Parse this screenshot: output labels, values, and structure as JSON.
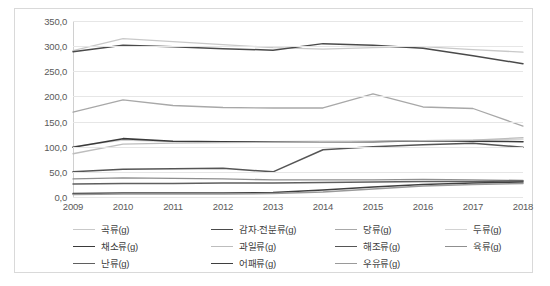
{
  "chart_data": {
    "type": "line",
    "title": "",
    "xlabel": "",
    "ylabel": "",
    "categories": [
      "2009",
      "2010",
      "2011",
      "2012",
      "2013",
      "2014",
      "2015",
      "2016",
      "2017",
      "2018"
    ],
    "ylim": [
      0,
      350
    ],
    "ytick_labels": [
      "0,0",
      "50,0",
      "100,0",
      "150,0",
      "200,0",
      "250,0",
      "300,0",
      "350,0"
    ],
    "ytick_values": [
      0,
      50,
      100,
      150,
      200,
      250,
      300,
      350
    ],
    "grid": true,
    "legend_position": "bottom",
    "series": [
      {
        "name": "곡류(g)",
        "color": "#c9c9c9",
        "width": 1.3,
        "values": [
          291,
          315,
          309,
          303,
          297,
          294,
          297,
          299,
          293,
          288
        ]
      },
      {
        "name": "감자·전분류(g)",
        "color": "#4a4a4a",
        "width": 1.5,
        "values": [
          289,
          302,
          299,
          295,
          292,
          305,
          302,
          296,
          281,
          265
        ]
      },
      {
        "name": "당류(g)",
        "color": "#a8a8a8",
        "width": 1.3,
        "values": [
          169,
          193,
          182,
          178,
          177,
          177,
          205,
          179,
          176,
          141
        ]
      },
      {
        "name": "두류(g)",
        "color": "#d2d2d2",
        "width": 1.3,
        "values": [
          100,
          113,
          110,
          110,
          110,
          111,
          110,
          112,
          113,
          115
        ]
      },
      {
        "name": "채소류(g)",
        "color": "#3a3a3a",
        "width": 1.6,
        "values": [
          99,
          116,
          111,
          110,
          110,
          110,
          110,
          112,
          111,
          110
        ]
      },
      {
        "name": "과일류(g)",
        "color": "#bdbdbd",
        "width": 1.3,
        "values": [
          86,
          105,
          107,
          108,
          109,
          110,
          111,
          112,
          113,
          118
        ]
      },
      {
        "name": "해조류(g)",
        "color": "#555555",
        "width": 1.5,
        "values": [
          50,
          55,
          56,
          57,
          50,
          94,
          100,
          104,
          107,
          99
        ]
      },
      {
        "name": "육류(g)",
        "color": "#8f8f8f",
        "width": 1.3,
        "values": [
          36,
          38,
          37,
          36,
          34,
          34,
          34,
          35,
          34,
          33
        ]
      },
      {
        "name": "난류(g)",
        "color": "#5f5f5f",
        "width": 1.5,
        "values": [
          26,
          27,
          27,
          28,
          28,
          29,
          30,
          31,
          31,
          32
        ]
      },
      {
        "name": "어패류(g)",
        "color": "#3f3f3f",
        "width": 1.5,
        "values": [
          7,
          8,
          8,
          8,
          9,
          14,
          20,
          25,
          28,
          30
        ]
      },
      {
        "name": "우유류(g)",
        "color": "#9a9a9a",
        "width": 1.5,
        "values": [
          5,
          6,
          6,
          6,
          7,
          10,
          16,
          22,
          25,
          27
        ]
      }
    ]
  },
  "legend_columns": [
    [
      {
        "label": "곡류(g)",
        "series": 0
      },
      {
        "label": "채소류(g)",
        "series": 4
      },
      {
        "label": "난류(g)",
        "series": 8
      }
    ],
    [
      {
        "label": "감자·전분류(g)",
        "series": 1
      },
      {
        "label": "과일류(g)",
        "series": 5
      },
      {
        "label": "어패류(g)",
        "series": 9
      }
    ],
    [
      {
        "label": "당류(g)",
        "series": 2
      },
      {
        "label": "해조류(g)",
        "series": 6
      },
      {
        "label": "우유류(g)",
        "series": 10
      }
    ],
    [
      {
        "label": "두류(g)",
        "series": 3
      },
      {
        "label": "육류(g)",
        "series": 7
      }
    ]
  ],
  "style": {
    "border_color": "#d9d9d9",
    "grid_color": "#e6e6e6",
    "tick_text_color": "#5a5a5a",
    "legend_text_color": "#404040",
    "background": "#ffffff"
  }
}
